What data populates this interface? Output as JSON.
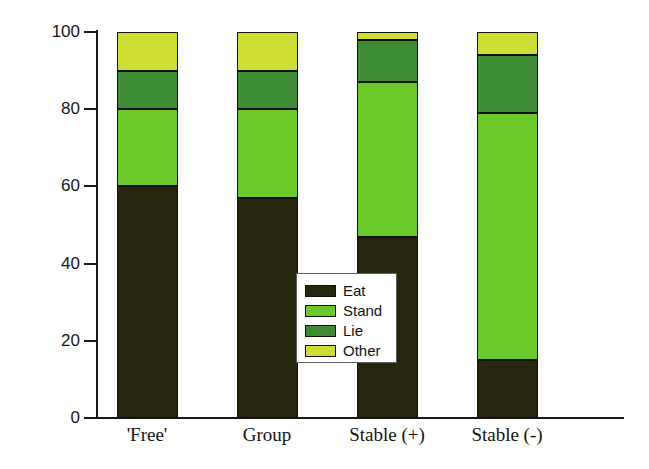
{
  "chart_data": {
    "type": "bar",
    "subtype": "stacked-bar-100-percent",
    "title": "",
    "xlabel": "",
    "ylabel": "",
    "ylim": [
      0,
      100
    ],
    "yticks": [
      0,
      20,
      40,
      60,
      80,
      100
    ],
    "ytick_labels": [
      "0",
      "20",
      "40",
      "60",
      "80",
      "100"
    ],
    "grid": false,
    "legend_position": "inside-center",
    "categories": [
      "'Free'",
      "Group",
      "Stable (+)",
      "Stable (-)"
    ],
    "series": [
      {
        "name": "Eat",
        "color": "#26260f",
        "values": [
          60,
          57,
          47,
          15
        ]
      },
      {
        "name": "Stand",
        "color": "#6ac82b",
        "values": [
          20,
          23,
          40,
          64
        ]
      },
      {
        "name": "Lie",
        "color": "#3d8c33",
        "values": [
          10,
          10,
          11,
          15
        ]
      },
      {
        "name": "Other",
        "color": "#cedd34",
        "values": [
          10,
          10,
          2,
          6
        ]
      }
    ],
    "cumulative_tops": {
      "'Free'": {
        "Eat": 60,
        "Stand": 80,
        "Lie": 90,
        "Other": 100
      },
      "Group": {
        "Eat": 57,
        "Stand": 80,
        "Lie": 90,
        "Other": 100
      },
      "Stable (+)": {
        "Eat": 47,
        "Stand": 87,
        "Lie": 98,
        "Other": 100
      },
      "Stable (-)": {
        "Eat": 15,
        "Stand": 79,
        "Lie": 94,
        "Other": 100
      }
    }
  },
  "legend": {
    "items": [
      {
        "label": "Eat",
        "color": "#26260f"
      },
      {
        "label": "Stand",
        "color": "#6ac82b"
      },
      {
        "label": "Lie",
        "color": "#3d8c33"
      },
      {
        "label": "Other",
        "color": "#cedd34"
      }
    ]
  },
  "axes": {
    "y_tick_labels": [
      "100",
      "80",
      "60",
      "40",
      "20",
      "0"
    ],
    "x_tick_labels": [
      "'Free'",
      "Group",
      "Stable (+)",
      "Stable (-)"
    ]
  },
  "colors": {
    "axis": "#1a1a1a",
    "background": "#ffffff",
    "segment_border": "#111108"
  }
}
